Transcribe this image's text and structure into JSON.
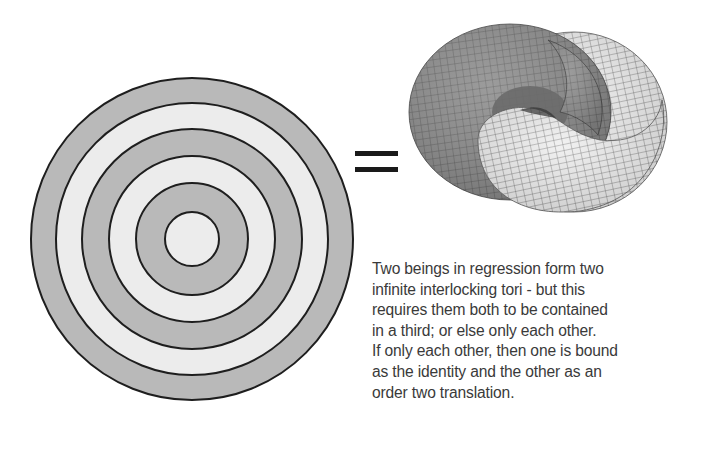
{
  "figure": {
    "concentric_circles": {
      "center": [
        192,
        239
      ],
      "radii": [
        161,
        136,
        110,
        83,
        56,
        27
      ],
      "fills": [
        "#b9b9b9",
        "#ececec",
        "#b9b9b9",
        "#ececec",
        "#b9b9b9",
        "#ececec"
      ],
      "stroke": "#1e1e1e"
    },
    "equals_sign": {
      "symbol": "=",
      "color": "#1a1a1a"
    },
    "tori": {
      "dark_torus_color": "#8d8d8d",
      "light_torus_color": "#eeeeee",
      "grid_color": "#4a4a4a"
    }
  },
  "caption": {
    "lines": [
      "Two beings in regression form two",
      "infinite interlocking tori - but this",
      "requires them both to be contained",
      "in a third; or else only each other.",
      "If only each other, then one is bound",
      "as the identity and the other as an",
      "order two translation."
    ]
  }
}
